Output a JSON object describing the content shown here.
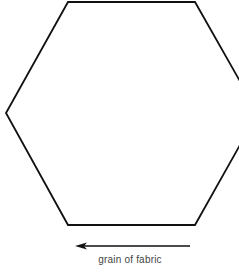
{
  "diagram": {
    "shape": "hexagon",
    "stroke_color": "#111111",
    "vertices": [
      [
        68,
        2
      ],
      [
        195,
        2
      ],
      [
        258,
        113
      ],
      [
        195,
        225
      ],
      [
        68,
        225
      ],
      [
        6,
        113
      ]
    ],
    "arrow": {
      "direction": "left",
      "from": [
        190,
        246
      ],
      "to": [
        76,
        246
      ],
      "color": "#111111"
    },
    "label": "grain of fabric"
  }
}
